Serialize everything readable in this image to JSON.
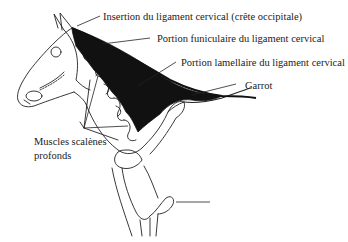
{
  "figure": {
    "labels": {
      "insertion": "Insertion du ligament cervical (crête occipitale)",
      "funiculaire": "Portion funiculaire du ligament cervical",
      "lamellaire": "Portion lamellaire du ligament cervical",
      "garrot": "Garrot",
      "scalenes_line1": "Muscles scalènes",
      "scalenes_line2": "profonds"
    },
    "colors": {
      "ink": "#222222",
      "ligament_fill": "#111111",
      "background": "#ffffff"
    }
  }
}
